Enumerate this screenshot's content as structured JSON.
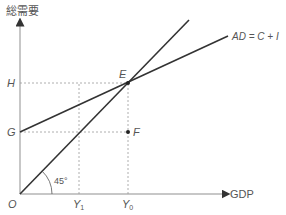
{
  "diagram": {
    "type": "Keynesian cross (45-degree line diagram)",
    "y_axis_label": "総需要",
    "x_axis_label": "GDP",
    "origin_label": "O",
    "curve_label": "AD = C + I",
    "angle_label": "45°",
    "points": {
      "E": "E",
      "F": "F",
      "G": "G",
      "H": "H"
    },
    "x_ticks": {
      "Y1": "Y",
      "Y1_sub": "1",
      "Y0": "Y",
      "Y0_sub": "0"
    },
    "colors": {
      "axis": "#b5b5b5",
      "line": "#333333",
      "dashed": "#9a9a9a",
      "text": "#555555"
    }
  }
}
